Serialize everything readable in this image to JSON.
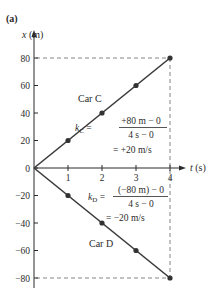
{
  "chart_data": {
    "type": "line",
    "panel_label": "(a)",
    "title": "",
    "xlabel": "t (s)",
    "ylabel": "x (m)",
    "xlabel_var": "t",
    "xlabel_unit": "(s)",
    "ylabel_var": "x",
    "ylabel_unit": "(m)",
    "xlim": [
      0,
      4
    ],
    "ylim": [
      -80,
      80
    ],
    "x_ticks": [
      1,
      2,
      3,
      4
    ],
    "x_tick_labels": [
      "1",
      "2",
      "3",
      "4"
    ],
    "y_ticks": [
      80,
      60,
      40,
      20,
      0,
      -20,
      -40,
      -60,
      -80
    ],
    "y_tick_labels": [
      "80",
      "60",
      "40",
      "20",
      "0",
      "−20",
      "−40",
      "−60",
      "−80"
    ],
    "grid": false,
    "reference_lines": [
      {
        "type": "horizontal",
        "y": 80,
        "x_range": [
          0,
          4
        ],
        "style": "dashed"
      },
      {
        "type": "horizontal",
        "y": -80,
        "x_range": [
          0,
          4
        ],
        "style": "dashed"
      },
      {
        "type": "vertical",
        "x": 4,
        "y_range": [
          -80,
          80
        ],
        "style": "dashed"
      }
    ],
    "series": [
      {
        "name": "Car C",
        "x": [
          0,
          1,
          2,
          3,
          4
        ],
        "y": [
          0,
          20,
          40,
          60,
          80
        ],
        "color": "#3a3a3a"
      },
      {
        "name": "Car D",
        "x": [
          0,
          1,
          2,
          3,
          4
        ],
        "y": [
          0,
          -20,
          -40,
          -60,
          -80
        ],
        "color": "#3a3a3a"
      }
    ],
    "annotations": [
      {
        "label": "Car C",
        "slope_symbol": "k",
        "slope_subscript": "C",
        "numerator": "+80 m − 0",
        "denominator": "4 s − 0",
        "result": "= +20 m/s"
      },
      {
        "label": "Car D",
        "slope_symbol": "k",
        "slope_subscript": "D",
        "numerator": "(−80 m) − 0",
        "denominator": "4 s − 0",
        "result": "= −20 m/s"
      }
    ]
  }
}
